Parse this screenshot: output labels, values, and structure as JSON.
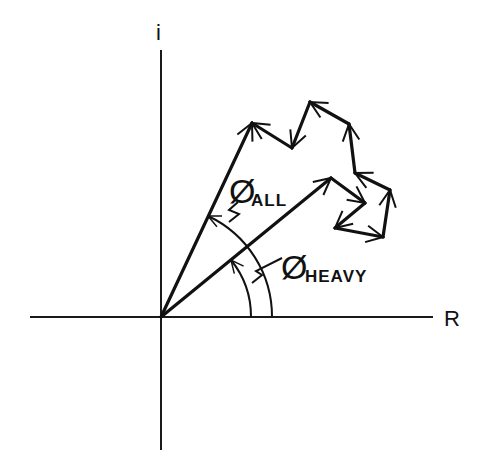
{
  "diagram": {
    "type": "phasor_vector_sum",
    "origin": [
      161,
      317
    ],
    "axes": {
      "real_label": "R",
      "imag_label": "i",
      "horizontal": {
        "x1": 30,
        "x2": 433,
        "y": 317
      },
      "vertical": {
        "x": 161,
        "y1": 50,
        "y2": 450
      }
    },
    "resultants": [
      {
        "name": "all",
        "label": "Ø",
        "subscript": "ALL",
        "tip": [
          252,
          123
        ]
      },
      {
        "name": "heavy",
        "label": "Ø",
        "subscript": "HEAVY",
        "tip": [
          331,
          178
        ]
      }
    ],
    "chain_points": [
      [
        331,
        178
      ],
      [
        365,
        203
      ],
      [
        335,
        228
      ],
      [
        383,
        237
      ],
      [
        390,
        190
      ],
      [
        355,
        173
      ],
      [
        349,
        124
      ],
      [
        310,
        102
      ],
      [
        292,
        148
      ],
      [
        252,
        123
      ]
    ],
    "angle_arcs": [
      {
        "name": "phi-heavy-arc",
        "radius": 90,
        "to_angle_deg": 39.3
      },
      {
        "name": "phi-all-arc",
        "radius": 111,
        "to_angle_deg": 64.9
      }
    ],
    "labels": {
      "phi_all": {
        "phi": "Ø",
        "sub": "ALL"
      },
      "phi_heavy": {
        "phi": "Ø",
        "sub": "HEAVY"
      }
    }
  }
}
